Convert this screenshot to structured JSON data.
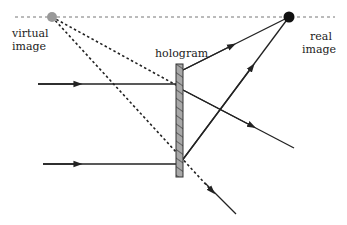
{
  "labels": {
    "virtual_line1": "virtual",
    "virtual_line2": "image",
    "hologram": "hologram",
    "real_line1": "real",
    "real_line2": "image"
  },
  "colors": {
    "line": "#222222",
    "plate_fill": "#a8a8a8",
    "virtual_point": "#999999",
    "real_point": "#111111",
    "dashed_axis": "#777777"
  }
}
